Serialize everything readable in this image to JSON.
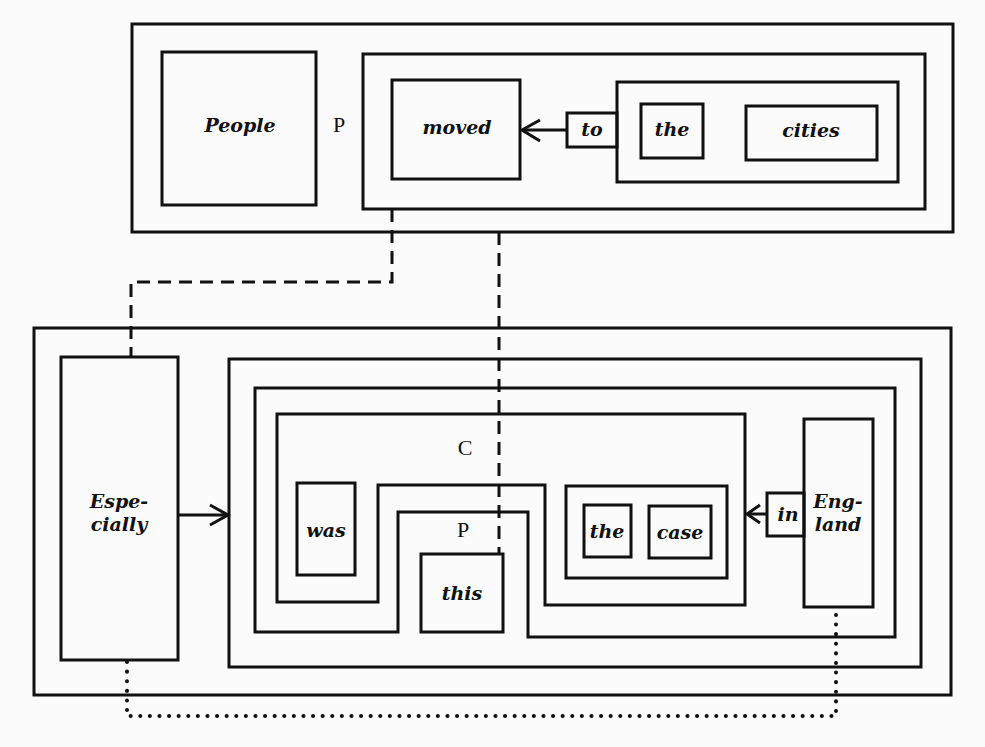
{
  "diagram": {
    "top": {
      "words": {
        "people": "People",
        "moved": "moved",
        "to": "to",
        "the": "the",
        "cities": "cities"
      },
      "labels": {
        "p": "P"
      }
    },
    "bottom": {
      "words": {
        "especially": "Espe-\ncially",
        "was": "was",
        "this": "this",
        "the": "the",
        "case": "case",
        "in": "in",
        "england": "Eng-\nland"
      },
      "labels": {
        "c": "C",
        "p": "P"
      }
    },
    "colors": {
      "line": "#111111",
      "background": "#fbfbfb"
    }
  }
}
